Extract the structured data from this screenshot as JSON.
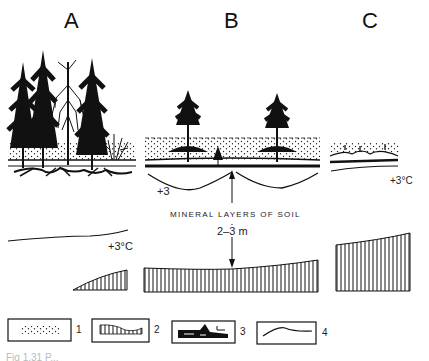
{
  "panels": [
    {
      "id": "A",
      "label": "A",
      "temperature_label": "+3°C"
    },
    {
      "id": "B",
      "label": "B",
      "temperature_label": "+3",
      "annotation": "MINERAL LAYERS OF SOIL",
      "depth_label": "2–3 m"
    },
    {
      "id": "C",
      "label": "C",
      "temperature_label": "+3°C"
    }
  ],
  "legend": [
    {
      "number": "1",
      "symbol": "dotted-layer",
      "description": ""
    },
    {
      "number": "2",
      "symbol": "hatched-permafrost",
      "description": ""
    },
    {
      "number": "3",
      "symbol": "black-root-layer",
      "description": ""
    },
    {
      "number": "4",
      "symbol": "isotherm-line",
      "description": ""
    }
  ],
  "caption": "Fig 1.31 P..."
}
